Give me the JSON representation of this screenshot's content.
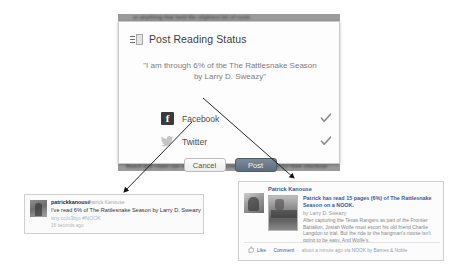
{
  "background": {
    "top_text": "or anything that held the slightest bit of room",
    "bottom_text": "Reach and share can not support of business, and were low for their checkout"
  },
  "dialog": {
    "title": "Post Reading Status",
    "badge_icon": "book-badge-icon",
    "quote": "\"I am through 6% of the The Rattlesnake Season by Larry D. Sweazy\"",
    "services": [
      {
        "name": "Facebook",
        "icon": "facebook-icon",
        "checked": true,
        "check_icon": "checkmark-icon"
      },
      {
        "name": "Twitter",
        "icon": "twitter-bird-icon",
        "checked": true,
        "check_icon": "checkmark-icon"
      }
    ],
    "buttons": {
      "cancel": "Cancel",
      "post": "Post"
    }
  },
  "twitter_card": {
    "avatar_icon": "user-avatar",
    "handle": "patrickkanouse",
    "real_name": "Patrick Kanouse",
    "body": "I've read 6% of The Rattlesnake Season by Larry D. Sweazy",
    "link": "tiny.cc/u3bjn #NOOK",
    "time": "16 seconds ago"
  },
  "facebook_card": {
    "avatar_icon": "user-avatar",
    "author": "Patrick Kanouse",
    "thumbnail_icon": "book-cover-thumbnail",
    "headline": "Patrick has read 15 pages (6%) of The Rattlesnake Season on a NOOK.",
    "byline": "by Larry D. Sweazy",
    "description": "After capturing the Texas Rangers as part of the Frontier Battalion, Josiah Wolfe must escort his old friend Charlie Langdon to trial. But the ride to the hangman's noose isn't going to be easy. And Wolfe's.",
    "footer": {
      "thumbs_icon": "thumbs-up-icon",
      "like": "Like",
      "sep": "·",
      "comment": "Comment",
      "meta": "about a minute ago via ",
      "source": "NOOK by Barnes & Noble"
    }
  },
  "colors": {
    "facebook_blue": "#3b5998",
    "post_button": "#5d6c7c",
    "check_gray": "#8a8a8a"
  }
}
